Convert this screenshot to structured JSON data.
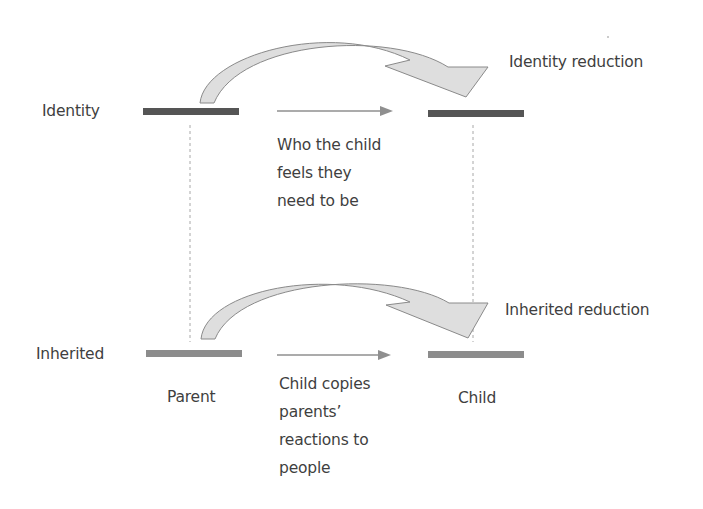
{
  "rows": [
    {
      "name": "Identity",
      "label": "Identity",
      "reduction_label": "Identity reduction",
      "description_lines": [
        "Who the child",
        "feels they",
        "need to be"
      ],
      "bar_color": "#555555"
    },
    {
      "name": "Inherited",
      "label": "Inherited",
      "reduction_label": "Inherited reduction",
      "description_lines": [
        "Child copies",
        "parents’",
        "reactions to",
        "people"
      ],
      "bar_color": "#8c8c8c"
    }
  ],
  "columns": {
    "left": "Parent",
    "right": "Child"
  },
  "colors": {
    "curved_arrow_fill": "#dedede",
    "curved_arrow_stroke": "#8a8a8a",
    "straight_arrow": "#8f8f8f",
    "dotted_line": "#a8a8a8",
    "text": "#3f3f3f"
  }
}
